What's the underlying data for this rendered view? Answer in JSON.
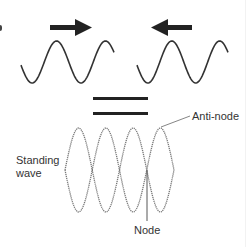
{
  "diagram": {
    "travelling_waves": [
      {
        "name": "wave-moving-right",
        "direction": "right",
        "cycles": 2
      },
      {
        "name": "wave-moving-left",
        "direction": "left",
        "cycles": 2
      }
    ],
    "operator": "=",
    "standing_wave": {
      "loops": 4,
      "nodes": 5
    },
    "labels": {
      "standing_wave": [
        "Standing",
        "wave"
      ],
      "anti_node": "Anti-node",
      "node": "Node"
    },
    "colors": {
      "wave_stroke": "#333333",
      "standing_stroke": "#777777",
      "arrow_fill": "#222222",
      "text": "#333333"
    }
  }
}
